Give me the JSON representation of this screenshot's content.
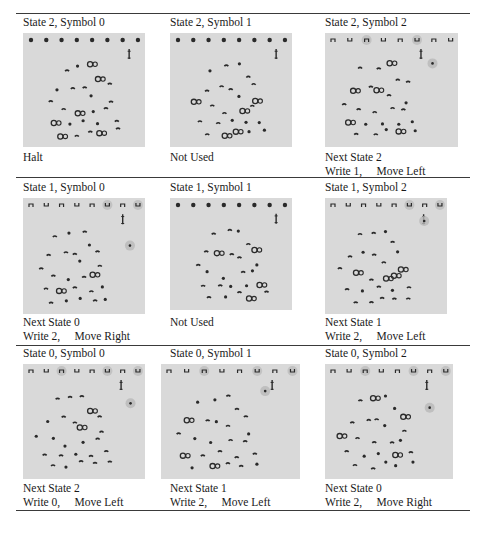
{
  "figure": {
    "rows": [
      {
        "cells": [
          {
            "title": "State 2, Symbol 0",
            "caption_line1": "Halt",
            "caption_line2": "",
            "tape_type": "dots",
            "used": false
          },
          {
            "title": "State 2, Symbol 1",
            "caption_line1": "Not Used",
            "caption_line2": "",
            "tape_type": "dots",
            "used": false
          },
          {
            "title": "State 2, Symbol 2",
            "caption_line1": "Next State 2",
            "caption_line2": "Write 1,     Move Left",
            "tape_type": "cups",
            "used": true
          }
        ]
      },
      {
        "cells": [
          {
            "title": "State 1, Symbol 0",
            "caption_line1": "Next State 0",
            "caption_line2": "Write 2,     Move Right",
            "tape_type": "cups",
            "used": true
          },
          {
            "title": "State 1, Symbol 1",
            "caption_line1": "Not Used",
            "caption_line2": "",
            "tape_type": "dots",
            "used": false
          },
          {
            "title": "State 1, Symbol 2",
            "caption_line1": "Next State 1",
            "caption_line2": "Write 2,     Move Left",
            "tape_type": "cups",
            "used": true
          }
        ]
      },
      {
        "cells": [
          {
            "title": "State 0, Symbol 0",
            "caption_line1": "Next State 2",
            "caption_line2": "Write 0,     Move Left",
            "tape_type": "cups",
            "used": true
          },
          {
            "title": "State 0, Symbol 1",
            "caption_line1": "Next State 1",
            "caption_line2": "Write 2,     Move Left",
            "tape_type": "cups",
            "used": true
          },
          {
            "title": "State 0, Symbol 2",
            "caption_line1": "Next State 0",
            "caption_line2": "Write 2,     Move Right",
            "tape_type": "cups",
            "used": true
          }
        ]
      }
    ]
  },
  "colors": {
    "panel_bg": "#d9d9d9",
    "rule": "#3a3a3a",
    "glyph": "#2a2a2a",
    "highlight": "#b8b8b8"
  }
}
